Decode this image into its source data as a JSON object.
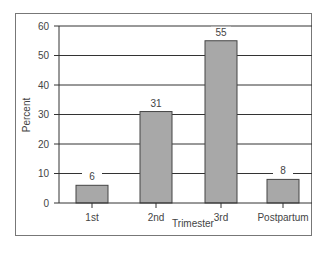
{
  "chart_data": {
    "type": "bar",
    "title": "",
    "xlabel": "Trimester",
    "ylabel": "Percent",
    "categories": [
      "1st",
      "2nd",
      "3rd",
      "Postpartum"
    ],
    "values": [
      6,
      31,
      55,
      8
    ],
    "data_labels": [
      "6",
      "31",
      "55",
      "8"
    ],
    "ylim": [
      0,
      60
    ],
    "yticks": [
      "0",
      "10",
      "20",
      "30",
      "40",
      "50",
      "60"
    ],
    "grid": true,
    "legend": null,
    "colors": {
      "bar": "#a8a8a8",
      "bar_border": "#444444",
      "grid": "#333333"
    }
  }
}
